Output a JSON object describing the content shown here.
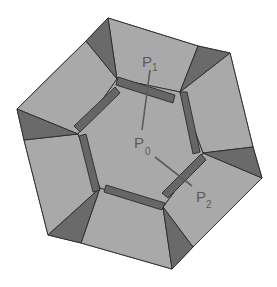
{
  "diagram": {
    "colors": {
      "face": "#a9a9a9",
      "wedge": "#6a6a6a",
      "bar": "#666666",
      "outline": "#2b2b2b",
      "label": "#5a5a5a",
      "background": "#ffffff"
    },
    "labels": [
      {
        "id": "p0",
        "main": "P",
        "sub": "0"
      },
      {
        "id": "p1",
        "main": "P",
        "sub": "1"
      },
      {
        "id": "p2",
        "main": "P",
        "sub": "2"
      }
    ]
  }
}
